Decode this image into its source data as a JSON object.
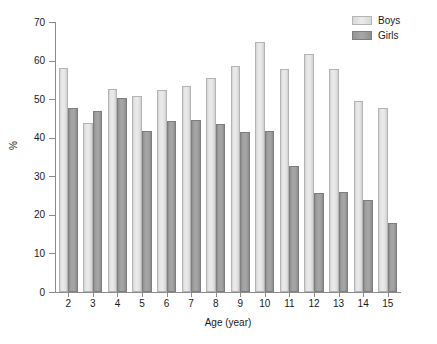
{
  "chart_data": {
    "type": "bar",
    "title": "",
    "xlabel": "Age (year)",
    "ylabel": "%",
    "categories": [
      "2",
      "3",
      "4",
      "5",
      "6",
      "7",
      "8",
      "9",
      "10",
      "11",
      "12",
      "13",
      "14",
      "15"
    ],
    "series": [
      {
        "name": "Boys",
        "color": "#e4e4e4",
        "values": [
          58.0,
          43.8,
          52.6,
          50.7,
          52.5,
          53.5,
          55.6,
          58.5,
          64.8,
          57.7,
          61.8,
          57.7,
          49.6,
          47.6
        ]
      },
      {
        "name": "Girls",
        "color": "#a0a0a0",
        "values": [
          47.8,
          47.0,
          50.3,
          41.8,
          44.4,
          44.5,
          43.6,
          41.6,
          41.7,
          32.8,
          25.8,
          26.0,
          23.8,
          18.0
        ]
      }
    ],
    "ylim": [
      0,
      70
    ],
    "yticks": [
      0,
      10,
      20,
      30,
      40,
      50,
      60,
      70
    ],
    "ytick_labels": [
      "0",
      "10",
      "20",
      "30",
      "40",
      "50",
      "60",
      "70"
    ],
    "grid": false,
    "legend_position": "top-right",
    "legend_entries": [
      "Boys",
      "Girls"
    ]
  }
}
